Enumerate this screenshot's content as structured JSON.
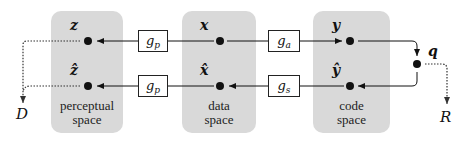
{
  "panels": [
    {
      "id": "perceptual",
      "caption_line1": "perceptual",
      "caption_line2": "space",
      "top_var": "z",
      "bottom_var": "ẑ"
    },
    {
      "id": "data",
      "caption_line1": "data",
      "caption_line2": "space",
      "top_var": "x",
      "bottom_var": "x̂"
    },
    {
      "id": "code",
      "caption_line1": "code",
      "caption_line2": "space",
      "top_var": "y",
      "bottom_var": "ŷ"
    }
  ],
  "functions": {
    "gp_top": {
      "base": "g",
      "sub": "p"
    },
    "gp_bottom": {
      "base": "g",
      "sub": "p"
    },
    "ga": {
      "base": "g",
      "sub": "a"
    },
    "gs": {
      "base": "g",
      "sub": "s"
    }
  },
  "quantizer": {
    "label": "q"
  },
  "outputs": {
    "distortion": "D",
    "rate": "R"
  },
  "colors": {
    "panel": "#d9d9d9",
    "line": "#111111",
    "dotted": "#444444"
  }
}
